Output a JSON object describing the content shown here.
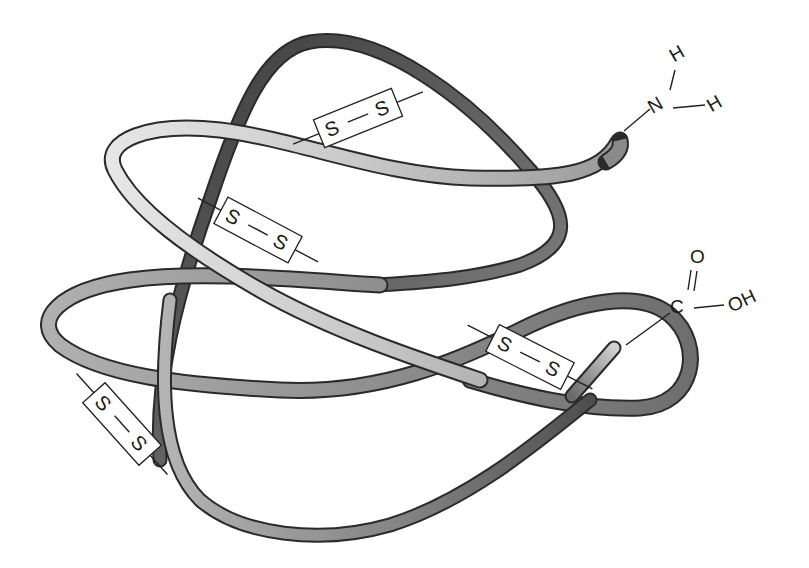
{
  "figure": {
    "amino_terminus": {
      "atom_n": "N",
      "atom_h1": "H",
      "atom_h2": "H"
    },
    "carboxyl_terminus": {
      "atom_c": "C",
      "atom_o": "O",
      "group_oh": "OH"
    },
    "disulfide_bridges": [
      {
        "s1": "S",
        "s2": "S",
        "bond": "—"
      },
      {
        "s1": "S",
        "s2": "S",
        "bond": "—"
      },
      {
        "s1": "S",
        "s2": "S",
        "bond": "—"
      },
      {
        "s1": "S",
        "s2": "S",
        "bond": "—"
      }
    ],
    "colors": {
      "background": "#ffffff",
      "ribbon_light": "#d8d8d8",
      "ribbon_mid": "#9a9a9a",
      "ribbon_dark": "#5a5a5a",
      "ribbon_darkest": "#3a3a3a",
      "outline": "#2a2a2a",
      "text": "#1a1a1a"
    }
  }
}
